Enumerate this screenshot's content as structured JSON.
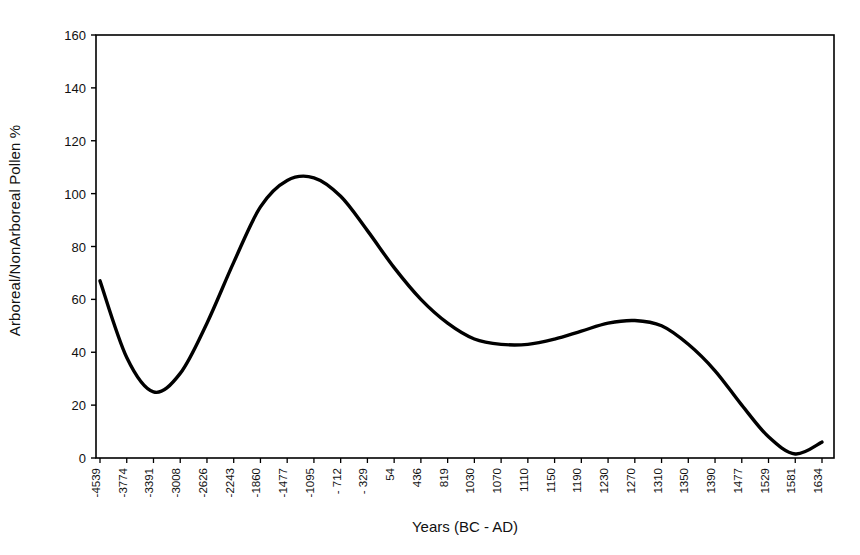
{
  "chart_data": {
    "type": "line",
    "title": "",
    "xlabel": "Years (BC - AD)",
    "ylabel": "Arboreal/NonArboreal Pollen %",
    "grid": false,
    "legend": "none",
    "ylim": [
      0,
      160
    ],
    "yticks": [
      0,
      20,
      40,
      60,
      80,
      100,
      120,
      140,
      160
    ],
    "categories": [
      "-4539",
      "-3774",
      "-3391",
      "-3008",
      "-2626",
      "-2243",
      "-1860",
      "-1477",
      "-1095",
      "- 712",
      "- 329",
      "54",
      "436",
      "819",
      "1030",
      "1070",
      "1110",
      "1150",
      "1190",
      "1230",
      "1270",
      "1310",
      "1350",
      "1390",
      "1477",
      "1529",
      "1581",
      "1634"
    ],
    "series": [
      {
        "name": "Arboreal/NonArboreal Pollen %",
        "color": "#000000",
        "values": [
          67,
          38,
          25,
          32,
          51,
          74,
          95,
          105,
          106,
          99,
          86,
          72,
          60,
          51,
          45,
          43,
          43,
          45,
          48,
          51,
          52,
          50,
          43,
          33,
          20,
          8,
          1.5,
          6
        ]
      }
    ],
    "annotations": [
      {
        "label": "initial value",
        "x": "-4539",
        "y": 67
      },
      {
        "label": "first minimum",
        "x": "-3391",
        "y": 25
      },
      {
        "label": "main peak",
        "x": "-1095",
        "y": 106
      },
      {
        "label": "mid trough",
        "x": "1110",
        "y": 43
      },
      {
        "label": "secondary peak",
        "x": "1270",
        "y": 52
      },
      {
        "label": "final minimum",
        "x": "1581",
        "y": 1.5
      },
      {
        "label": "end value",
        "x": "1634",
        "y": 6
      }
    ]
  },
  "axes": {
    "y_axis_title": "Arboreal/NonArboreal Pollen %",
    "x_axis_title": "Years (BC - AD)",
    "y_tick_labels": [
      "0",
      "20",
      "40",
      "60",
      "80",
      "100",
      "120",
      "140",
      "160"
    ],
    "x_tick_labels": [
      "-4539",
      "-3774",
      "-3391",
      "-3008",
      "-2626",
      "-2243",
      "-1860",
      "-1477",
      "-1095",
      "- 712",
      "- 329",
      "54",
      "436",
      "819",
      "1030",
      "1070",
      "1110",
      "1150",
      "1190",
      "1230",
      "1270",
      "1310",
      "1350",
      "1390",
      "1477",
      "1529",
      "1581",
      "1634"
    ]
  },
  "style": {
    "line_color": "#000000",
    "axis_color": "#000000",
    "background": "#ffffff"
  }
}
